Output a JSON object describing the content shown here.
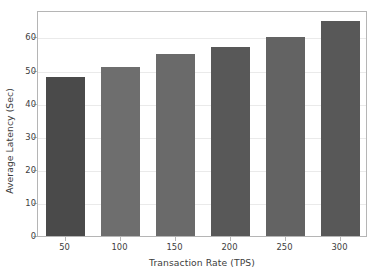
{
  "chart_data": {
    "type": "bar",
    "title": "",
    "xlabel": "Transaction Rate (TPS)",
    "ylabel": "Average Latency (Sec)",
    "categories": [
      "50",
      "100",
      "150",
      "200",
      "250",
      "300"
    ],
    "values": [
      48,
      51,
      55,
      57,
      60,
      65
    ],
    "series": [
      {
        "name": "Average Latency (Sec)",
        "values": [
          48,
          51,
          55,
          57,
          60,
          65
        ]
      }
    ],
    "bar_colors": [
      "#4a4a4a",
      "#6e6e6e",
      "#6a6a6a",
      "#585858",
      "#636363",
      "#585858"
    ],
    "ylim": [
      0,
      68
    ],
    "yticks": [
      0,
      10,
      20,
      30,
      40,
      50,
      60
    ],
    "ytick_labels": [
      "0",
      "10",
      "20",
      "30",
      "40",
      "50",
      "60"
    ],
    "xticks": [
      50,
      100,
      150,
      200,
      250,
      300
    ],
    "xtick_labels": [
      "50",
      "100",
      "150",
      "200",
      "250",
      "300"
    ],
    "grid": true,
    "grid_axis": "y",
    "grid_color": "#eaeaea",
    "legend": null,
    "legend_position": "none",
    "axes_border_color": "#b5b5b5",
    "background_color": "#ffffff",
    "text_color": "#3d3d3d",
    "annotations": []
  }
}
